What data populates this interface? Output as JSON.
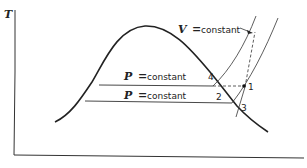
{
  "diagram": {
    "type": "T-s diagram (saturation dome)",
    "axes": {
      "y_label": "T",
      "x_label": ""
    },
    "annotations": {
      "v_constant_var": "V",
      "v_constant_eq": "=",
      "v_constant_text": "constant",
      "p_constant_upper_var": "P",
      "p_constant_upper_eq": "=",
      "p_constant_upper_text": "constant",
      "p_constant_lower_var": "P",
      "p_constant_lower_eq": "=",
      "p_constant_lower_text": "constant"
    },
    "points": [
      {
        "id": "1",
        "label": "1"
      },
      {
        "id": "2",
        "label": "2"
      },
      {
        "id": "3",
        "label": "3"
      },
      {
        "id": "4",
        "label": "4"
      }
    ],
    "colors": {
      "stroke": "#222222",
      "background": "#ffffff"
    }
  }
}
